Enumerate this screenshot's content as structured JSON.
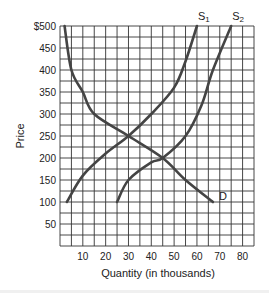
{
  "chart_data": {
    "type": "line",
    "title": "",
    "xlabel": "Quantity (in thousands)",
    "ylabel": "Price",
    "xlim": [
      0,
      85
    ],
    "ylim": [
      0,
      500
    ],
    "grid": true,
    "x_ticks": [
      10,
      20,
      30,
      40,
      50,
      60,
      70,
      80
    ],
    "x_tick_labels": [
      "10",
      "20",
      "30",
      "40",
      "50",
      "60",
      "70",
      "80"
    ],
    "y_ticks": [
      50,
      100,
      150,
      200,
      250,
      300,
      350,
      400,
      450,
      500
    ],
    "y_tick_labels": [
      "50",
      "100",
      "150",
      "200",
      "250",
      "300",
      "350",
      "400",
      "450",
      "$500"
    ],
    "grid_step_x": 5,
    "grid_step_y": 25,
    "series": [
      {
        "name": "D",
        "label": "D",
        "points": [
          [
            2,
            500
          ],
          [
            5,
            400
          ],
          [
            10,
            350
          ],
          [
            15,
            300
          ],
          [
            30,
            250
          ],
          [
            45,
            200
          ],
          [
            55,
            150
          ],
          [
            67,
            100
          ]
        ]
      },
      {
        "name": "S1",
        "label": "S",
        "subscript": "1",
        "points": [
          [
            3,
            100
          ],
          [
            10,
            160
          ],
          [
            20,
            210
          ],
          [
            30,
            250
          ],
          [
            40,
            300
          ],
          [
            50,
            360
          ],
          [
            55,
            420
          ],
          [
            60,
            500
          ]
        ]
      },
      {
        "name": "S2",
        "label": "S",
        "subscript": "2",
        "points": [
          [
            25,
            100
          ],
          [
            30,
            150
          ],
          [
            40,
            190
          ],
          [
            45,
            200
          ],
          [
            55,
            250
          ],
          [
            62,
            320
          ],
          [
            67,
            400
          ],
          [
            75,
            500
          ]
        ]
      }
    ],
    "equilibria": [
      {
        "curves": [
          "D",
          "S1"
        ],
        "quantity": 30,
        "price": 250
      },
      {
        "curves": [
          "D",
          "S2"
        ],
        "quantity": 45,
        "price": 200
      }
    ]
  }
}
